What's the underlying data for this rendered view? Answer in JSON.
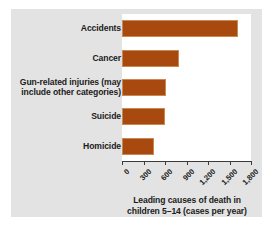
{
  "chart_data": {
    "type": "bar",
    "orientation": "horizontal",
    "title": "",
    "xlabel": "Leading causes of death in children 5–14 (cases per year)",
    "ylabel": "",
    "categories": [
      "Accidents",
      "Cancer",
      "Gun-related injuries (may include other categories)",
      "Suicide",
      "Homicide"
    ],
    "values": [
      1620,
      800,
      620,
      600,
      450
    ],
    "xlim": [
      0,
      1800
    ],
    "xticks": [
      0,
      300,
      600,
      900,
      1200,
      1500,
      1800
    ],
    "xtick_labels": [
      "0",
      "300",
      "600",
      "900",
      "1,200",
      "1,500",
      "1,800"
    ],
    "grid": false,
    "legend": false,
    "bar_color": "#a8490f",
    "bar_edge_color": "#c98a52",
    "panel_color": "#e3e3e3",
    "plot_bg_color": "#ffffff"
  },
  "axis_title_lines": [
    "Leading causes of death in",
    "children 5–14 (cases per year)"
  ],
  "category_label_lines": [
    [
      "Accidents"
    ],
    [
      "Cancer"
    ],
    [
      "Gun-related injuries (may",
      "include other categories)"
    ],
    [
      "Suicide"
    ],
    [
      "Homicide"
    ]
  ]
}
